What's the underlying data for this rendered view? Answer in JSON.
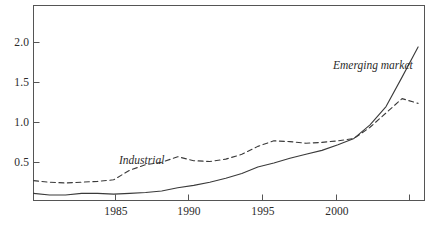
{
  "chart_data": {
    "type": "line",
    "title": "",
    "subtitle": "",
    "xlabel": "",
    "ylabel": "",
    "xlim": [
      1981,
      2005.4
    ],
    "ylim": [
      0,
      2.45
    ],
    "grid": false,
    "legend_position": "inline-annotation",
    "x_tick_labels": [
      "1985",
      "1990",
      "1995",
      "2000"
    ],
    "x_ticks": [
      1985,
      1990,
      1995,
      2000,
      2005
    ],
    "y_tick_labels": [
      "0.5",
      "1.0",
      "1.5",
      "2.0"
    ],
    "y_ticks": [
      0.5,
      1.0,
      1.5,
      2.0
    ],
    "x": [
      1981,
      1982,
      1983,
      1984,
      1985,
      1986,
      1987,
      1988,
      1989,
      1990,
      1991,
      1992,
      1993,
      1994,
      1995,
      1996,
      1997,
      1998,
      1999,
      2000,
      2001,
      2002,
      2003,
      2004,
      2005
    ],
    "series": [
      {
        "name": "Industrial",
        "style": "dashed",
        "color": "#3a3a3a",
        "annotation": "Industrial",
        "values": [
          0.25,
          0.23,
          0.22,
          0.23,
          0.24,
          0.26,
          0.38,
          0.45,
          0.48,
          0.55,
          0.5,
          0.49,
          0.52,
          0.58,
          0.68,
          0.75,
          0.74,
          0.72,
          0.73,
          0.75,
          0.78,
          0.92,
          1.1,
          1.28,
          1.22
        ]
      },
      {
        "name": "Emerging market",
        "style": "solid",
        "color": "#3a3a3a",
        "annotation": "Emerging market",
        "values": [
          0.09,
          0.07,
          0.07,
          0.09,
          0.09,
          0.08,
          0.09,
          0.1,
          0.12,
          0.16,
          0.19,
          0.23,
          0.28,
          0.34,
          0.42,
          0.47,
          0.53,
          0.58,
          0.63,
          0.7,
          0.78,
          0.95,
          1.18,
          1.55,
          1.93
        ]
      }
    ]
  },
  "axes": {
    "y_labels": [
      {
        "text": "2.0",
        "value": 2.0
      },
      {
        "text": "1.5",
        "value": 1.5
      },
      {
        "text": "1.0",
        "value": 1.0
      },
      {
        "text": "0.5",
        "value": 0.5
      }
    ],
    "x_labels": [
      {
        "text": "1985",
        "value": 1985
      },
      {
        "text": "1990",
        "value": 1990
      },
      {
        "text": "1995",
        "value": 1995
      },
      {
        "text": "2000",
        "value": 2000
      }
    ]
  },
  "annotations": {
    "emerging_market": "Emerging market",
    "industrial": "Industrial"
  },
  "colors": {
    "frame": "#555555",
    "line": "#3a3a3a",
    "text": "#2b2b2b",
    "background": "#ffffff"
  }
}
